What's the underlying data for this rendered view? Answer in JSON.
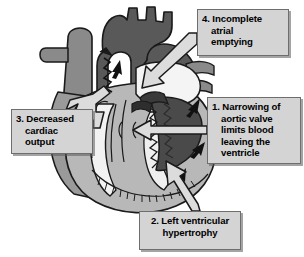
{
  "figure": {
    "background_color": "#ffffff",
    "palette": {
      "callout_fill": "#d4d4d4",
      "callout_border": "#6e6e6e",
      "callout_text": "#000000",
      "myocardium_light": "#b8b8b8",
      "myocardium_mid": "#8a8a8a",
      "vessel_dark": "#595959",
      "vessel_darkest": "#3a3a3a",
      "chamber_white": "#f2f2f2",
      "outline": "#1a1a1a",
      "arrow_fill": "#d9d9d9"
    }
  },
  "callouts": [
    {
      "id": "callout-1",
      "number": "1.",
      "lines": [
        "1. Narrowing of",
        "aortic valve",
        "limits blood",
        "leaving the",
        "ventricle"
      ],
      "text": "1. Narrowing of aortic valve limits blood leaving the ventricle",
      "points_to": "aortic-valve"
    },
    {
      "id": "callout-2",
      "number": "2.",
      "lines": [
        "2. Left ventricular",
        "hypertrophy"
      ],
      "text": "2. Left ventricular hypertrophy",
      "points_to": "left-ventricle-wall"
    },
    {
      "id": "callout-3",
      "number": "3.",
      "lines": [
        "3. Decreased",
        "cardiac",
        "output"
      ],
      "text": "3. Decreased cardiac output",
      "points_to": "aorta-outflow"
    },
    {
      "id": "callout-4",
      "number": "4.",
      "lines": [
        "4. Incomplete",
        "atrial",
        "emptying"
      ],
      "text": "4. Incomplete atrial emptying",
      "points_to": "left-atrium"
    }
  ],
  "anatomy_labels": {
    "aorta": "aorta",
    "pulmonary_artery": "pulmonary-artery",
    "superior_vena_cava": "superior-vena-cava",
    "left_atrium": "left-atrium",
    "left_ventricle": "left-ventricle",
    "right_ventricle": "right-ventricle",
    "aortic_valve": "aortic-valve",
    "thickened_septum": "thickened-septum"
  }
}
